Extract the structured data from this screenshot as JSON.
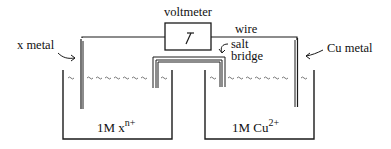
{
  "diagram": {
    "type": "electrochemical-cell",
    "labels": {
      "voltmeter": "voltmeter",
      "wire": "wire",
      "salt_bridge_line1": "salt",
      "salt_bridge_line2": "bridge",
      "left_electrode": "x metal",
      "right_electrode": "Cu metal",
      "left_solution_main": "1M x",
      "left_solution_sup": "n+",
      "right_solution_main": "1M Cu",
      "right_solution_sup": "2+"
    },
    "colors": {
      "stroke": "#1a1a1a",
      "background": "#ffffff",
      "solution_wave": "#555555"
    }
  }
}
